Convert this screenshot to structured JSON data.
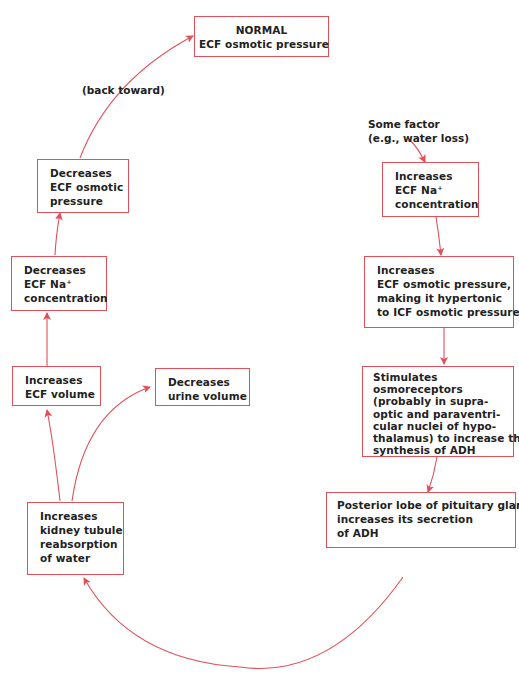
{
  "colors": {
    "accent": "#e0505a",
    "text": "#222222",
    "background": "#ffffff"
  },
  "nodes": {
    "normal": {
      "lines": [
        "NORMAL",
        "ECF osmotic pressure"
      ]
    },
    "back_toward": {
      "text": "(back toward)"
    },
    "some_factor": {
      "lines": [
        "Some factor",
        "(e.g., water loss)"
      ]
    },
    "inc_na": {
      "lines": [
        "Increases",
        "ECF Na⁺",
        "concentration"
      ]
    },
    "inc_osm": {
      "lines": [
        "Increases",
        "ECF osmotic pressure,",
        "making it hypertonic",
        "to ICF osmotic pressure"
      ]
    },
    "stim_osmo": {
      "lines": [
        "Stimulates",
        "osmoreceptors",
        "(probably in supra-",
        "optic and paraventri-",
        "cular nuclei of hypo-",
        "thalamus)  to increase their",
        "synthesis of ADH"
      ]
    },
    "posterior": {
      "lines": [
        "Posterior lobe of pituitary gland",
        "increases its secretion",
        "of ADH"
      ]
    },
    "kidney": {
      "lines": [
        "Increases",
        "kidney tubule",
        "reabsorption",
        "of water"
      ]
    },
    "dec_urine": {
      "lines": [
        "Decreases",
        "urine volume"
      ]
    },
    "inc_ecf_vol": {
      "lines": [
        "Increases",
        "ECF volume"
      ]
    },
    "dec_na": {
      "lines": [
        "Decreases",
        "ECF Na⁺",
        "concentration"
      ]
    },
    "dec_osm": {
      "lines": [
        "Decreases",
        "ECF osmotic",
        "pressure"
      ]
    }
  }
}
